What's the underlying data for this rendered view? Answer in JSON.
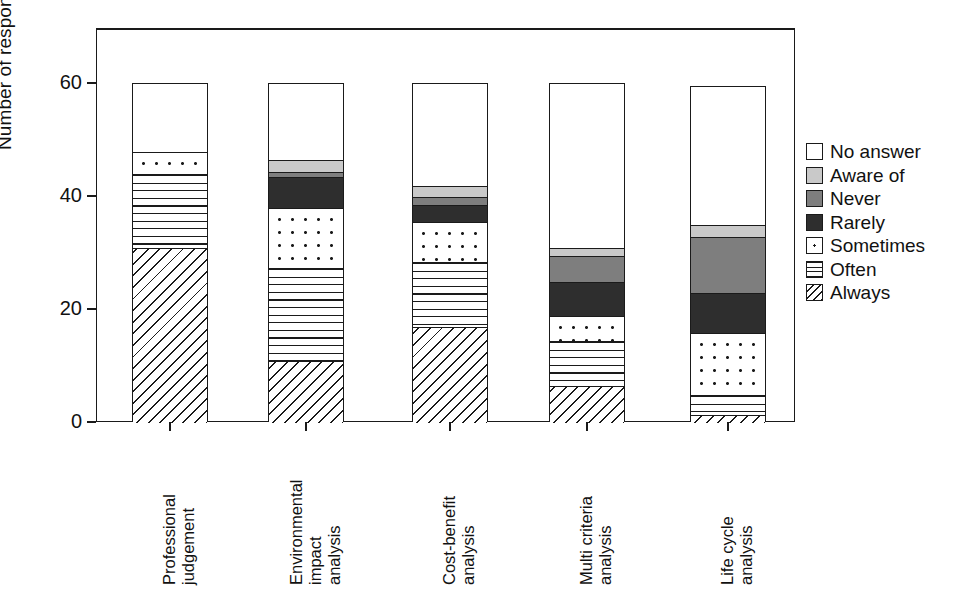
{
  "chart_data": {
    "type": "bar",
    "subtype": "stacked-vertical",
    "title": "",
    "xlabel": "",
    "ylabel": "Number of responses",
    "ylim": [
      0,
      68
    ],
    "yticks": [
      0,
      20,
      40,
      60
    ],
    "ytick_labels": [
      "0",
      "20",
      "40",
      "60"
    ],
    "grid": false,
    "legend_position": "right",
    "stack_order_bottom_to_top": [
      "Always",
      "Often",
      "Sometimes",
      "Rarely",
      "Never",
      "Aware of",
      "No answer"
    ],
    "categories": [
      "Professional judgement",
      "Environmental impact analysis",
      "Cost-benefit analysis",
      "Multi criteria analysis",
      "Life cycle analysis"
    ],
    "category_lines": [
      [
        "Professional",
        "judgement"
      ],
      [
        "Environmental",
        "impact",
        "analysis"
      ],
      [
        "Cost-benefit",
        "analysis"
      ],
      [
        "Multi criteria",
        "analysis"
      ],
      [
        "Life cycle",
        "analysis"
      ]
    ],
    "series": [
      {
        "name": "Always",
        "fill": "diag",
        "values": [
          31,
          11,
          17,
          6.5,
          1.5
        ]
      },
      {
        "name": "Often",
        "fill": "hlines",
        "values": [
          13,
          16.5,
          11.5,
          8,
          3.5
        ]
      },
      {
        "name": "Sometimes",
        "fill": "dots",
        "values": [
          4,
          10.5,
          7,
          4.5,
          11
        ]
      },
      {
        "name": "Rarely",
        "fill": "dark",
        "values": [
          0,
          5.5,
          3,
          6,
          7
        ]
      },
      {
        "name": "Never",
        "fill": "gray",
        "values": [
          0,
          1,
          1.5,
          4.5,
          10
        ]
      },
      {
        "name": "Aware of",
        "fill": "lightgray",
        "values": [
          0,
          2,
          2,
          1.5,
          2
        ]
      },
      {
        "name": "No answer",
        "fill": "none",
        "values": [
          12,
          13.5,
          18,
          29,
          24.5
        ]
      }
    ],
    "totals": [
      60,
      60,
      60,
      60,
      59.5
    ]
  },
  "legend": {
    "items": [
      {
        "label": "No answer",
        "fill": "none"
      },
      {
        "label": "Aware of",
        "fill": "lightgray"
      },
      {
        "label": "Never",
        "fill": "gray"
      },
      {
        "label": "Rarely",
        "fill": "dark"
      },
      {
        "label": "Sometimes",
        "fill": "dots"
      },
      {
        "label": "Often",
        "fill": "hlines"
      },
      {
        "label": "Always",
        "fill": "diag"
      }
    ]
  },
  "colors": {
    "axis": "#1a1a1a",
    "background": "#ffffff",
    "light_gray": "#c9c9c9",
    "medium_gray": "#7e7e7e",
    "dark_gray": "#2e2e2e"
  }
}
